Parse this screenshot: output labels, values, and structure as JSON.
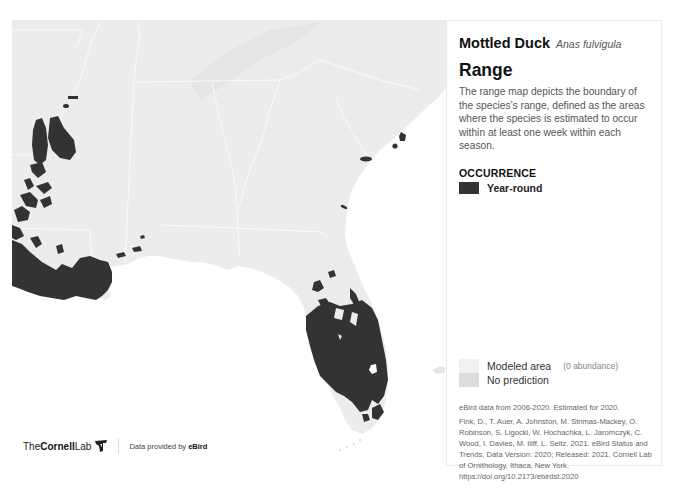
{
  "species": {
    "common_name": "Mottled Duck",
    "scientific_name": "Anas fulvigula"
  },
  "panel": {
    "heading": "Range",
    "description": "The range map depicts the boundary of the species’s range, defined as the areas where the species is estimated to occur within at least one week within each season.",
    "occurrence_heading": "OCCURRENCE",
    "legend": [
      {
        "label": "Year-round",
        "color": "#333333"
      }
    ],
    "secondary_legend": [
      {
        "label": "Modeled area",
        "sublabel": "(0 abundance)",
        "color": "#f1f1f1"
      },
      {
        "label": "No prediction",
        "sublabel": "",
        "color": "#dcdcdc"
      }
    ],
    "data_years": "eBird data from 2006-2020. Estimated for 2020.",
    "citation": "Fink, D., T. Auer, A. Johnston, M. Strimas-Mackey, O. Robinson, S. Ligocki, W. Hochachka, L. Jaromczyk, C. Wood, I. Davies, M. Iliff, L. Seitz. 2021. eBird Status and Trends, Data Version: 2020; Released: 2021. Cornell Lab of Ornithology, Ithaca, New York. https://doi.org/10.2173/ebirdst.2020"
  },
  "branding": {
    "the": "The",
    "cornell": "Cornell",
    "lab": "Lab",
    "provided_prefix": "Data provided by ",
    "provided_source": "eBird"
  },
  "map": {
    "region": "Southeastern United States",
    "land_color": "#ececec",
    "water_color": "#ffffff",
    "range_color": "#333333",
    "border_color": "#fafafa"
  }
}
